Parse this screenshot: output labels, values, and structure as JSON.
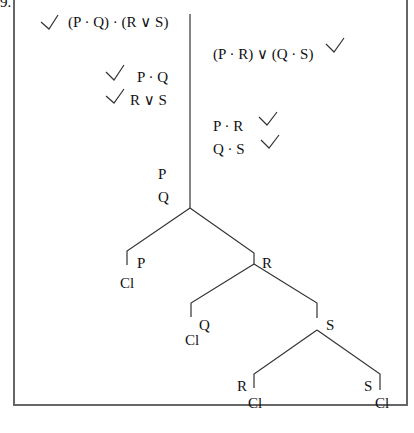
{
  "problem_number_fragment": "9.",
  "premises": [
    {
      "text": "(P · Q) · (R ∨ S)",
      "checked": true
    },
    {
      "text": "P · Q",
      "checked": true
    },
    {
      "text": "R ∨ S",
      "checked": true
    }
  ],
  "negated_conclusion": {
    "text": "(P · R) ∨ (Q · S)",
    "checked": true
  },
  "decomposed": [
    {
      "text": "P · R",
      "checked": true
    },
    {
      "text": "Q · S",
      "checked": true
    }
  ],
  "trunk_literals": [
    "P",
    "Q"
  ],
  "branches": {
    "level1_left": {
      "literal": "P",
      "status": "Cl"
    },
    "level1_right": {
      "literal": "R"
    },
    "level2_left": {
      "literal": "Q",
      "status": "Cl"
    },
    "level2_right": {
      "literal": "S"
    },
    "level3_left": {
      "literal": "R",
      "status": "Cl"
    },
    "level3_right": {
      "literal": "S",
      "status": "Cl"
    }
  },
  "icons": {
    "check": "check-icon"
  }
}
